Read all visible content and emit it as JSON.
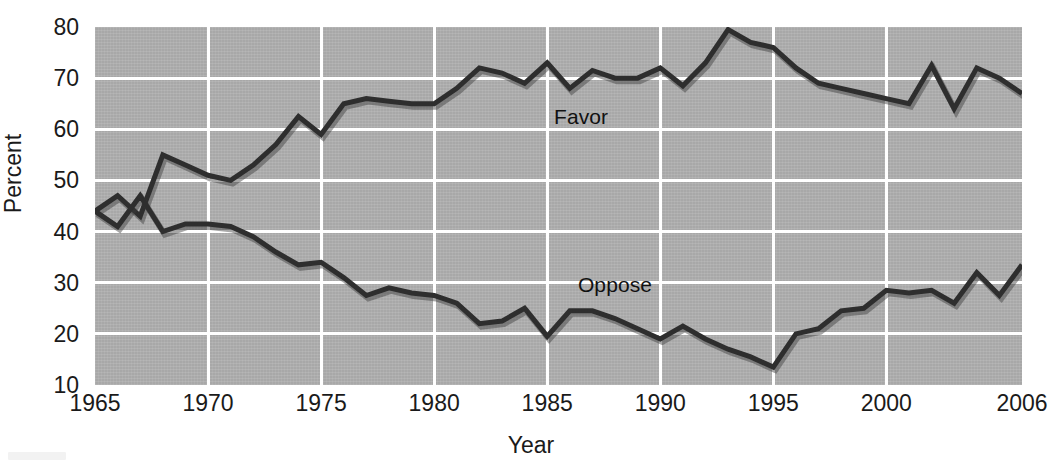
{
  "chart_data": {
    "type": "line",
    "title": "",
    "subtitle": "",
    "xlabel": "Year",
    "ylabel": "Percent",
    "xlim": [
      1965,
      2006
    ],
    "ylim": [
      10,
      80
    ],
    "grid": true,
    "legend_position": "inline-annotation",
    "x_ticks": [
      1965,
      1970,
      1975,
      1980,
      1985,
      1990,
      1995,
      2000,
      2006
    ],
    "y_ticks": [
      10,
      20,
      30,
      40,
      50,
      60,
      70,
      80
    ],
    "x": [
      1965,
      1966,
      1967,
      1968,
      1969,
      1970,
      1971,
      1972,
      1973,
      1974,
      1975,
      1976,
      1977,
      1978,
      1979,
      1980,
      1981,
      1982,
      1983,
      1984,
      1985,
      1986,
      1987,
      1988,
      1989,
      1990,
      1991,
      1992,
      1993,
      1994,
      1995,
      1996,
      1997,
      1998,
      1999,
      2000,
      2001,
      2002,
      2003,
      2004,
      2005,
      2006
    ],
    "series": [
      {
        "name": "Favor",
        "color": "#2e2e2e",
        "annotation": "Favor",
        "values": [
          44,
          47,
          43,
          55,
          53,
          51,
          50,
          53,
          57,
          62.5,
          59,
          65,
          66,
          65.5,
          65,
          65,
          68,
          72,
          71,
          69,
          73,
          68,
          71.5,
          70,
          70,
          72,
          68.5,
          73,
          79.5,
          77,
          76,
          72,
          69,
          68,
          67,
          66,
          65,
          72.5,
          64,
          72,
          70,
          67
        ]
      },
      {
        "name": "Oppose",
        "color": "#2e2e2e",
        "annotation": "Oppose",
        "values": [
          44,
          41,
          47,
          40,
          41.5,
          41.5,
          41,
          39,
          36,
          33.5,
          34,
          31,
          27.5,
          29,
          28,
          27.5,
          26,
          22,
          22.5,
          25,
          19.5,
          24.5,
          24.5,
          23,
          21,
          19,
          21.5,
          19,
          17,
          15.5,
          13.5,
          20,
          21,
          24.5,
          25,
          28.5,
          28,
          28.5,
          26,
          32,
          27.5,
          33.5
        ]
      }
    ],
    "annotations": [
      {
        "text": "Favor",
        "x": 1986.5,
        "y": 62.5
      },
      {
        "text": "Oppose",
        "x": 1988.0,
        "y": 29.5
      }
    ]
  },
  "axes": {
    "y_title": "Percent",
    "x_title": "Year",
    "y_tick_labels": [
      "80",
      "70",
      "60",
      "50",
      "40",
      "30",
      "20",
      "10"
    ],
    "x_tick_labels": [
      "1965",
      "1970",
      "1975",
      "1980",
      "1985",
      "1990",
      "1995",
      "2000",
      "2006"
    ]
  },
  "style": {
    "plot_background": "#a8a8a8",
    "gridline_color": "#ffffff",
    "line_color": "#2e2e2e",
    "text_color": "#1a1a1a",
    "page_background": "#ffffff"
  }
}
